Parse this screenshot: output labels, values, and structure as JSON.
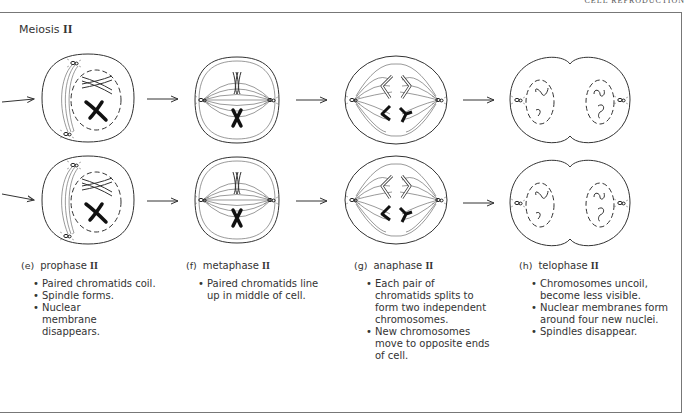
{
  "header": {
    "running_head": "CELL REPRODUCTION",
    "section_title": "Meiosis",
    "section_roman": "II"
  },
  "stages": [
    {
      "letter": "(e)",
      "name": "prophase",
      "roman": "II",
      "bullets": [
        "Paired chromatids coil.",
        "Spindle forms.",
        "Nuclear membrane disappears."
      ]
    },
    {
      "letter": "(f)",
      "name": "metaphase",
      "roman": "II",
      "bullets": [
        "Paired chromatids line up in middle of cell."
      ]
    },
    {
      "letter": "(g)",
      "name": "anaphase",
      "roman": "II",
      "bullets": [
        "Each pair of chromatids splits to form two independent chromosomes.",
        "New chromosomes move to opposite ends of cell."
      ]
    },
    {
      "letter": "(h)",
      "name": "telophase",
      "roman": "II",
      "bullets": [
        "Chromosomes uncoil, become less visible.",
        "Nuclear membranes form around four new nuclei.",
        "Spindles disappear."
      ]
    }
  ],
  "colors": {
    "line": "#333333",
    "frame": "#777777",
    "text": "#333333"
  }
}
